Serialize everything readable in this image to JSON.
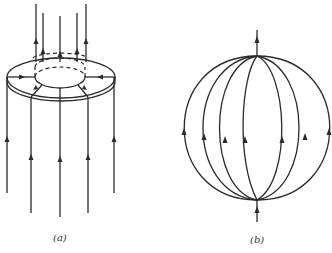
{
  "figure": {
    "panel_a": {
      "caption": "(a)",
      "description": "Field lines passing upward through a ring/annulus; lines below converge into the ring and emerge above through the inner hole"
    },
    "panel_b": {
      "caption": "(b)",
      "description": "Field lines entering at the bottom pole of a sphere, spreading along meridians and leaving at the top pole"
    },
    "colors": {
      "line": "#2a2a2a",
      "background": "#ffffff"
    }
  }
}
